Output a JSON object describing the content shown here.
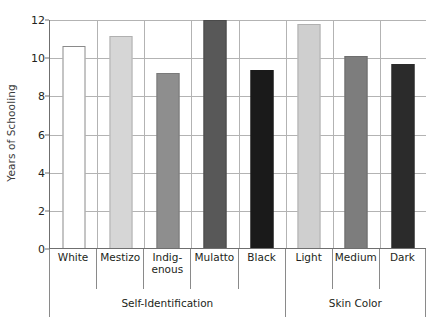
{
  "chart_data": {
    "type": "bar",
    "title": "",
    "subtitle": "",
    "xlabel": "",
    "ylabel": "Years of Schooling",
    "ylim": [
      0,
      12
    ],
    "ytick_labels": [
      "0",
      "2",
      "4",
      "6",
      "8",
      "10",
      "12"
    ],
    "ytick_values": [
      0,
      2,
      4,
      6,
      8,
      10,
      12
    ],
    "grid": true,
    "legend": "none",
    "categories": [
      "White",
      "Mestizo",
      "Indig-\nenous",
      "Mulatto",
      "Black",
      "Light",
      "Medium",
      "Dark"
    ],
    "values": [
      10.65,
      11.15,
      9.2,
      12.0,
      9.4,
      11.8,
      10.1,
      9.7
    ],
    "bar_colors": [
      "#ffffff",
      "#d6d6d6",
      "#8e8e8e",
      "#585858",
      "#1a1a1a",
      "#cfcfcf",
      "#7d7d7d",
      "#2b2b2b"
    ],
    "bar_border_colors": [
      "#8a8a8a",
      "#b0b0b0",
      "#7a7a7a",
      "#4a4a4a",
      "#1a1a1a",
      "#b0b0b0",
      "#6e6e6e",
      "#2b2b2b"
    ],
    "groups": [
      {
        "label": "Self-Identification",
        "span": 5
      },
      {
        "label": "Skin Color",
        "span": 3
      }
    ],
    "axis_color": "#6f6f6f",
    "gridline_color": "#b3b3b3",
    "text_color": "#231f20",
    "background": "#ffffff"
  },
  "category_labels": [
    {
      "line1": "White",
      "line2": ""
    },
    {
      "line1": "Mestizo",
      "line2": ""
    },
    {
      "line1": "Indig-",
      "line2": "enous"
    },
    {
      "line1": "Mulatto",
      "line2": ""
    },
    {
      "line1": "Black",
      "line2": ""
    },
    {
      "line1": "Light",
      "line2": ""
    },
    {
      "line1": "Medium",
      "line2": ""
    },
    {
      "line1": "Dark",
      "line2": ""
    }
  ]
}
